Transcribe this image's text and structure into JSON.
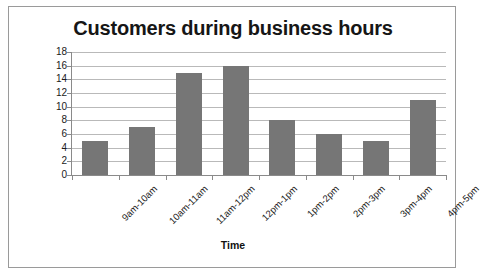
{
  "frame": {
    "border_color": "#9a9a9a",
    "background": "#ffffff"
  },
  "chart_data": {
    "type": "bar",
    "title": "Customers during business hours",
    "xlabel": "Time",
    "ylabel": "Number of customers",
    "categories": [
      "9am-10am",
      "10am-11am",
      "11am-12pm",
      "12pm-1pm",
      "1pm-2pm",
      "2pm-3pm",
      "3pm-4pm",
      "4pm-5pm"
    ],
    "values": [
      5,
      7,
      15,
      16,
      8,
      6,
      5,
      11
    ],
    "ylim": [
      0,
      18
    ],
    "ytick_step": 2,
    "yticks": [
      18,
      16,
      14,
      12,
      10,
      8,
      6,
      4,
      2,
      0
    ],
    "grid": true,
    "legend": false,
    "legend_position": "none",
    "bar_color": "#767676",
    "gridline_color": "#b9b9b9",
    "axis_color": "#8a8a8a",
    "text_color": "#1a1a1a"
  }
}
